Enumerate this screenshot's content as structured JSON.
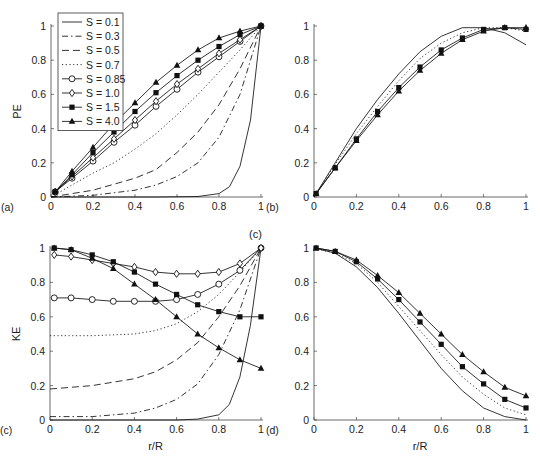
{
  "figure": {
    "panel_labels": [
      "(a)",
      "(b)",
      "(c)",
      "(c)",
      "(d)"
    ]
  },
  "legend": [
    {
      "label": "S = 0.1",
      "style": "solid",
      "marker": "none"
    },
    {
      "label": "S = 0.3",
      "style": "dashdot",
      "marker": "none"
    },
    {
      "label": "S = 0.5",
      "style": "dashed",
      "marker": "none"
    },
    {
      "label": "S = 0.7",
      "style": "dotted",
      "marker": "none"
    },
    {
      "label": "S = 0.85",
      "style": "solid",
      "marker": "circle"
    },
    {
      "label": "S = 1.0",
      "style": "solid",
      "marker": "diamond"
    },
    {
      "label": "S = 1.5",
      "style": "solid",
      "marker": "square"
    },
    {
      "label": "S = 4.0",
      "style": "solid",
      "marker": "triangle"
    }
  ],
  "chart_data": [
    {
      "id": "a",
      "type": "line",
      "panel_label": "(a)",
      "ylabel": "PE",
      "xlabel": "",
      "xlim": [
        0,
        1
      ],
      "ylim": [
        0,
        1
      ],
      "xticks": [
        "0",
        "0.2",
        "0.4",
        "0.6",
        "0.8",
        "1"
      ],
      "yticks": [
        "0",
        "0.2",
        "0.4",
        "0.6",
        "0.8",
        "1"
      ],
      "series": [
        {
          "name": "S = 0.1",
          "style": "solid",
          "marker": "none",
          "x": [
            0,
            0.5,
            0.7,
            0.8,
            0.85,
            0.9,
            0.95,
            1
          ],
          "y": [
            0,
            0,
            0.003,
            0.02,
            0.06,
            0.18,
            0.45,
            1
          ]
        },
        {
          "name": "S = 0.3",
          "style": "dashdot",
          "marker": "none",
          "x": [
            0,
            0.2,
            0.4,
            0.5,
            0.6,
            0.7,
            0.8,
            0.9,
            1
          ],
          "y": [
            0,
            0.01,
            0.04,
            0.07,
            0.12,
            0.2,
            0.35,
            0.6,
            1
          ]
        },
        {
          "name": "S = 0.5",
          "style": "dashed",
          "marker": "none",
          "x": [
            0,
            0.2,
            0.4,
            0.5,
            0.6,
            0.7,
            0.8,
            0.9,
            1
          ],
          "y": [
            0,
            0.04,
            0.11,
            0.16,
            0.26,
            0.38,
            0.54,
            0.75,
            1
          ]
        },
        {
          "name": "S = 0.7",
          "style": "dotted",
          "marker": "none",
          "x": [
            0,
            0.1,
            0.2,
            0.3,
            0.4,
            0.5,
            0.6,
            0.7,
            0.8,
            0.9,
            1
          ],
          "y": [
            0,
            0.07,
            0.14,
            0.2,
            0.28,
            0.37,
            0.48,
            0.6,
            0.73,
            0.86,
            1
          ]
        },
        {
          "name": "S = 0.85",
          "style": "solid",
          "marker": "circle",
          "x": [
            0.02,
            0.1,
            0.2,
            0.3,
            0.4,
            0.5,
            0.6,
            0.7,
            0.8,
            0.9,
            1
          ],
          "y": [
            0.03,
            0.11,
            0.21,
            0.32,
            0.42,
            0.53,
            0.63,
            0.73,
            0.82,
            0.91,
            1
          ]
        },
        {
          "name": "S = 1.0",
          "style": "solid",
          "marker": "diamond",
          "x": [
            0.02,
            0.1,
            0.2,
            0.3,
            0.4,
            0.5,
            0.6,
            0.7,
            0.8,
            0.9,
            1
          ],
          "y": [
            0.03,
            0.12,
            0.23,
            0.34,
            0.45,
            0.56,
            0.66,
            0.75,
            0.84,
            0.92,
            1
          ]
        },
        {
          "name": "S = 1.5",
          "style": "solid",
          "marker": "square",
          "x": [
            0.02,
            0.1,
            0.2,
            0.3,
            0.4,
            0.5,
            0.6,
            0.7,
            0.8,
            0.9,
            1
          ],
          "y": [
            0.03,
            0.13,
            0.26,
            0.38,
            0.5,
            0.61,
            0.71,
            0.8,
            0.88,
            0.95,
            1
          ]
        },
        {
          "name": "S = 4.0",
          "style": "solid",
          "marker": "triangle",
          "x": [
            0.02,
            0.1,
            0.2,
            0.3,
            0.4,
            0.5,
            0.6,
            0.7,
            0.8,
            0.9,
            1
          ],
          "y": [
            0.03,
            0.15,
            0.29,
            0.43,
            0.55,
            0.67,
            0.77,
            0.86,
            0.93,
            0.97,
            1
          ]
        }
      ]
    },
    {
      "id": "b",
      "type": "line",
      "panel_label": "(b)",
      "ylabel": "",
      "xlabel": "",
      "xlim": [
        0,
        1
      ],
      "ylim": [
        0,
        1
      ],
      "xticks": [
        "0",
        "0.2",
        "0.4",
        "0.6",
        "0.8",
        "1"
      ],
      "yticks": [
        "0",
        "0.2",
        "0.4",
        "0.6",
        "0.8",
        "1"
      ],
      "series": [
        {
          "name": "S = 0.1",
          "style": "solid",
          "marker": "none",
          "x": [
            0,
            0.1,
            0.2,
            0.3,
            0.4,
            0.5,
            0.6,
            0.7,
            0.8,
            0.9,
            1
          ],
          "y": [
            0,
            0.2,
            0.4,
            0.57,
            0.72,
            0.85,
            0.94,
            0.99,
            0.99,
            0.96,
            0.89
          ]
        },
        {
          "name": "S = 0.7",
          "style": "dotted",
          "marker": "none",
          "x": [
            0,
            0.1,
            0.2,
            0.3,
            0.4,
            0.5,
            0.6,
            0.7,
            0.8,
            0.9,
            1
          ],
          "y": [
            0,
            0.19,
            0.37,
            0.53,
            0.68,
            0.81,
            0.9,
            0.96,
            0.99,
            0.99,
            0.97
          ]
        },
        {
          "name": "S = 1.5",
          "style": "solid",
          "marker": "square",
          "x": [
            0.01,
            0.1,
            0.2,
            0.3,
            0.4,
            0.5,
            0.6,
            0.7,
            0.8,
            0.9,
            1
          ],
          "y": [
            0.02,
            0.17,
            0.34,
            0.5,
            0.64,
            0.76,
            0.86,
            0.93,
            0.98,
            0.99,
            0.98
          ]
        },
        {
          "name": "S = 4.0",
          "style": "solid",
          "marker": "triangle",
          "x": [
            0.01,
            0.1,
            0.2,
            0.3,
            0.4,
            0.5,
            0.6,
            0.7,
            0.8,
            0.9,
            1
          ],
          "y": [
            0.02,
            0.17,
            0.33,
            0.48,
            0.62,
            0.74,
            0.84,
            0.92,
            0.97,
            0.99,
            0.99
          ]
        }
      ]
    },
    {
      "id": "c",
      "type": "line",
      "panel_label": "(c)",
      "ylabel": "KE",
      "xlabel": "r/R",
      "xlim": [
        0,
        1
      ],
      "ylim": [
        0,
        1
      ],
      "xticks": [
        "0",
        "0.2",
        "0.4",
        "0.6",
        "0.8",
        "1"
      ],
      "yticks": [
        "0",
        "0.2",
        "0.4",
        "0.6",
        "0.8",
        "1"
      ],
      "series": [
        {
          "name": "S = 0.1",
          "style": "solid",
          "marker": "none",
          "x": [
            0,
            0.6,
            0.7,
            0.8,
            0.85,
            0.9,
            0.95,
            1
          ],
          "y": [
            0,
            0,
            0.005,
            0.03,
            0.09,
            0.25,
            0.55,
            1
          ]
        },
        {
          "name": "S = 0.3",
          "style": "dashdot",
          "marker": "none",
          "x": [
            0,
            0.2,
            0.4,
            0.5,
            0.6,
            0.7,
            0.8,
            0.9,
            1
          ],
          "y": [
            0.02,
            0.02,
            0.04,
            0.07,
            0.12,
            0.21,
            0.38,
            0.64,
            1
          ]
        },
        {
          "name": "S = 0.5",
          "style": "dashed",
          "marker": "none",
          "x": [
            0,
            0.2,
            0.4,
            0.5,
            0.6,
            0.7,
            0.8,
            0.9,
            1
          ],
          "y": [
            0.18,
            0.2,
            0.24,
            0.28,
            0.35,
            0.45,
            0.6,
            0.78,
            1
          ]
        },
        {
          "name": "S = 0.7",
          "style": "dotted",
          "marker": "none",
          "x": [
            0,
            0.2,
            0.4,
            0.5,
            0.6,
            0.7,
            0.8,
            0.9,
            1
          ],
          "y": [
            0.49,
            0.49,
            0.5,
            0.52,
            0.56,
            0.63,
            0.73,
            0.86,
            1
          ]
        },
        {
          "name": "S = 0.85",
          "style": "solid",
          "marker": "circle",
          "x": [
            0.02,
            0.1,
            0.2,
            0.3,
            0.4,
            0.5,
            0.6,
            0.7,
            0.8,
            0.9,
            1
          ],
          "y": [
            0.71,
            0.71,
            0.7,
            0.69,
            0.69,
            0.69,
            0.7,
            0.73,
            0.79,
            0.87,
            1
          ]
        },
        {
          "name": "S = 1.0",
          "style": "solid",
          "marker": "diamond",
          "x": [
            0.02,
            0.1,
            0.2,
            0.3,
            0.4,
            0.5,
            0.6,
            0.7,
            0.8,
            0.9,
            1
          ],
          "y": [
            0.96,
            0.95,
            0.93,
            0.91,
            0.89,
            0.86,
            0.85,
            0.85,
            0.86,
            0.91,
            1
          ]
        },
        {
          "name": "S = 1.5",
          "style": "solid",
          "marker": "square",
          "x": [
            0.02,
            0.1,
            0.2,
            0.3,
            0.4,
            0.5,
            0.6,
            0.7,
            0.8,
            0.9,
            1
          ],
          "y": [
            1.0,
            0.99,
            0.96,
            0.92,
            0.86,
            0.79,
            0.73,
            0.67,
            0.63,
            0.6,
            0.6
          ]
        },
        {
          "name": "S = 4.0",
          "style": "solid",
          "marker": "triangle",
          "x": [
            0.02,
            0.1,
            0.2,
            0.3,
            0.4,
            0.5,
            0.6,
            0.7,
            0.8,
            0.9,
            1
          ],
          "y": [
            1.0,
            0.99,
            0.94,
            0.88,
            0.79,
            0.7,
            0.6,
            0.5,
            0.42,
            0.35,
            0.3
          ]
        }
      ]
    },
    {
      "id": "d",
      "type": "line",
      "panel_label": "(d)",
      "ylabel": "",
      "xlabel": "r/R",
      "xlim": [
        0,
        1
      ],
      "ylim": [
        0,
        1
      ],
      "xticks": [
        "0",
        "0.2",
        "0.4",
        "0.6",
        "0.8",
        "1"
      ],
      "yticks": [
        "0",
        "0.2",
        "0.4",
        "0.6",
        "0.8",
        "1"
      ],
      "series": [
        {
          "name": "S = 0.1",
          "style": "solid",
          "marker": "none",
          "x": [
            0,
            0.1,
            0.2,
            0.3,
            0.4,
            0.5,
            0.6,
            0.7,
            0.8,
            0.9,
            1
          ],
          "y": [
            1,
            0.97,
            0.89,
            0.77,
            0.62,
            0.46,
            0.3,
            0.17,
            0.07,
            0.02,
            0
          ]
        },
        {
          "name": "S = 0.7",
          "style": "dotted",
          "marker": "none",
          "x": [
            0,
            0.1,
            0.2,
            0.3,
            0.4,
            0.5,
            0.6,
            0.7,
            0.8,
            0.9,
            1
          ],
          "y": [
            1,
            0.97,
            0.91,
            0.8,
            0.66,
            0.52,
            0.38,
            0.25,
            0.15,
            0.07,
            0.03
          ]
        },
        {
          "name": "S = 1.5",
          "style": "solid",
          "marker": "square",
          "x": [
            0.01,
            0.1,
            0.2,
            0.3,
            0.4,
            0.5,
            0.6,
            0.7,
            0.8,
            0.9,
            1
          ],
          "y": [
            1,
            0.98,
            0.92,
            0.82,
            0.7,
            0.57,
            0.44,
            0.31,
            0.21,
            0.12,
            0.07
          ]
        },
        {
          "name": "S = 4.0",
          "style": "solid",
          "marker": "triangle",
          "x": [
            0.01,
            0.1,
            0.2,
            0.3,
            0.4,
            0.5,
            0.6,
            0.7,
            0.8,
            0.9,
            1
          ],
          "y": [
            1,
            0.98,
            0.93,
            0.84,
            0.74,
            0.62,
            0.5,
            0.38,
            0.28,
            0.19,
            0.14
          ]
        }
      ]
    }
  ]
}
